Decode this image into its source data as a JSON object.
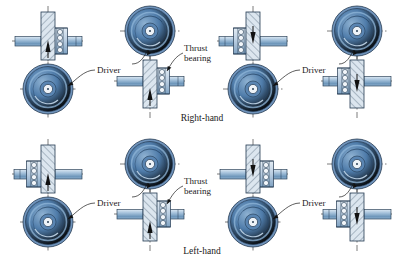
{
  "figure": {
    "title_visible": false,
    "type": "engineering-line-diagram"
  },
  "captions": {
    "right_hand": "Right-hand",
    "left_hand": "Left-hand"
  },
  "labels": {
    "driver": "Driver",
    "thrust": "Thrust",
    "bearing": "bearing",
    "thrust_bearing_full": "Thrust bearing"
  },
  "colors": {
    "gear_rim": "#6f93bb",
    "gear_mid": "#4b76a6",
    "gear_face": "#3f6d9e",
    "gear_light": "#b9cde1",
    "hub": "#e8eef5",
    "shaft": "#8fb0cf",
    "shaft_light": "#cfe0ee",
    "worm_fill": "#dce6ef",
    "bearing_housing": "#c6d6e5",
    "outline": "#243a52",
    "centerline": "#111111",
    "text": "#1a1a1a",
    "page": "#ffffff"
  },
  "rows": [
    {
      "id": "row-right-hand",
      "hand": "Right-hand",
      "caption": "Right-hand",
      "assemblies": [
        {
          "id": "assembly-1",
          "gear_position": "below",
          "bearing_side": "right",
          "driver_label": "Driver",
          "thrust_label": null
        },
        {
          "id": "assembly-2",
          "gear_position": "above",
          "bearing_side": "right",
          "driver_label": "Driver",
          "thrust_label": "Thrust bearing"
        },
        {
          "id": "assembly-3",
          "gear_position": "below",
          "bearing_side": "left",
          "driver_label": "Driver",
          "thrust_label": null
        },
        {
          "id": "assembly-4",
          "gear_position": "above",
          "bearing_side": "left",
          "driver_label": "Driver",
          "thrust_label": null
        }
      ]
    },
    {
      "id": "row-left-hand",
      "hand": "Left-hand",
      "caption": "Left-hand",
      "assemblies": [
        {
          "id": "assembly-5",
          "gear_position": "below",
          "bearing_side": "left",
          "driver_label": "Driver",
          "thrust_label": null
        },
        {
          "id": "assembly-6",
          "gear_position": "above",
          "bearing_side": "right",
          "driver_label": "Driver",
          "thrust_label": "Thrust bearing"
        },
        {
          "id": "assembly-7",
          "gear_position": "below",
          "bearing_side": "right",
          "driver_label": "Driver",
          "thrust_label": null
        },
        {
          "id": "assembly-8",
          "gear_position": "above",
          "bearing_side": "left",
          "driver_label": "Driver",
          "thrust_label": null
        }
      ]
    }
  ]
}
